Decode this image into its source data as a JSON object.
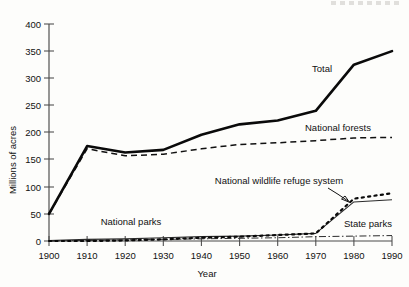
{
  "chart_data": {
    "type": "line",
    "title": "",
    "xlabel": "Year",
    "ylabel": "Millions of acres",
    "xlim": [
      1900,
      1990
    ],
    "ylim": [
      0,
      400
    ],
    "grid": false,
    "legend_position": "inline-annotations",
    "x": [
      1900,
      1910,
      1920,
      1930,
      1940,
      1950,
      1960,
      1970,
      1980,
      1990
    ],
    "xticks": [
      "1900",
      "1910",
      "1920",
      "1930",
      "1940",
      "1950",
      "1960",
      "1970",
      "1980",
      "1990"
    ],
    "yticks": [
      "0",
      "50",
      "100",
      "150",
      "200",
      "250",
      "300",
      "350",
      "400"
    ],
    "series": [
      {
        "name": "Total",
        "style": "thick-solid",
        "label": "Total",
        "values": [
          50,
          175,
          163,
          168,
          196,
          215,
          222,
          240,
          325,
          350
        ]
      },
      {
        "name": "National forests",
        "style": "dashed",
        "label": "National forests",
        "values": [
          50,
          170,
          157,
          160,
          170,
          178,
          181,
          185,
          190,
          191
        ]
      },
      {
        "name": "National parks",
        "style": "thin-solid",
        "label": "National parks",
        "values": [
          1,
          3,
          4,
          6,
          8,
          9,
          11,
          14,
          72,
          76
        ]
      },
      {
        "name": "National wildlife refuge system",
        "style": "dotted",
        "label": "National wildlife refuge system",
        "values": [
          0,
          0,
          1,
          3,
          6,
          8,
          11,
          14,
          78,
          88
        ]
      },
      {
        "name": "State parks",
        "style": "dash-dot",
        "label": "State parks",
        "values": [
          0,
          1,
          2,
          3,
          4,
          5,
          6,
          8,
          9,
          10
        ]
      }
    ],
    "annotations": [
      {
        "name": "total-label",
        "text": "Total"
      },
      {
        "name": "national-forests-label",
        "text": "National forests"
      },
      {
        "name": "national-parks-label",
        "text": "National parks"
      },
      {
        "name": "refuge-label",
        "text": "National wildlife refuge system"
      },
      {
        "name": "state-parks-label",
        "text": "State parks"
      }
    ]
  }
}
